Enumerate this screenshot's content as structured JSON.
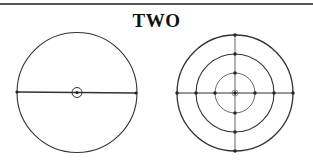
{
  "title": "TWO",
  "figures": {
    "left": {
      "description": "single circle with horizontal diameter and center marker",
      "center": [
        77,
        92.5
      ],
      "radius": 60,
      "diameter_endpoints": [
        [
          17,
          92
        ],
        [
          136,
          93
        ]
      ],
      "center_marker_radius": 5
    },
    "right": {
      "description": "three concentric circles with crossing diameters and node points",
      "center": [
        235,
        93
      ],
      "radii": [
        20,
        39,
        58
      ],
      "colors": {
        "stroke": "#333333"
      }
    }
  },
  "colors": {
    "stroke": "#333333",
    "rule": "#555555",
    "background": "#ffffff"
  }
}
